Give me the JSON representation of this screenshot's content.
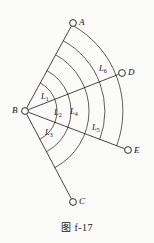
{
  "figure": {
    "caption_prefix": "图",
    "caption_number": "f-17",
    "caption_full": "图 f-17",
    "background_color": "#fbfbf9",
    "stroke_color": "#1a1a1a"
  },
  "vertices": [
    {
      "id": "A",
      "label": "A",
      "cx": 73,
      "cy": 23,
      "r": 3.4,
      "label_x": 79,
      "label_y": 18
    },
    {
      "id": "B",
      "label": "B",
      "cx": 25,
      "cy": 111,
      "r": 3.4,
      "label_x": 12,
      "label_y": 106
    },
    {
      "id": "C",
      "label": "C",
      "cx": 73,
      "cy": 202,
      "r": 3.4,
      "label_x": 79,
      "label_y": 197
    },
    {
      "id": "D",
      "label": "D",
      "cx": 122,
      "cy": 73,
      "r": 3.4,
      "label_x": 128,
      "label_y": 68
    },
    {
      "id": "E",
      "label": "E",
      "cx": 128,
      "cy": 150,
      "r": 3.4,
      "label_x": 134,
      "label_y": 146
    }
  ],
  "rays": [
    {
      "id": "BA",
      "from": "B",
      "to": "A"
    },
    {
      "id": "BD",
      "from": "B",
      "to": "D"
    },
    {
      "id": "BE",
      "from": "B",
      "to": "E"
    },
    {
      "id": "BC",
      "from": "B",
      "to": "C"
    }
  ],
  "arc_labels": [
    {
      "id": "L1",
      "base": "L",
      "sub": "1",
      "x": 41,
      "y": 92
    },
    {
      "id": "L2",
      "base": "L",
      "sub": "2",
      "x": 54,
      "y": 108
    },
    {
      "id": "L3",
      "base": "L",
      "sub": "3",
      "x": 45,
      "y": 128
    },
    {
      "id": "L4",
      "base": "L",
      "sub": "4",
      "x": 70,
      "y": 107
    },
    {
      "id": "L5",
      "base": "L",
      "sub": "5",
      "x": 92,
      "y": 123
    },
    {
      "id": "L6",
      "base": "L",
      "sub": "6",
      "x": 99,
      "y": 64
    }
  ],
  "arcs": [
    {
      "id": "arc-L1-inner",
      "radius": 32,
      "from_ray": "BA",
      "to_ray": "BD"
    },
    {
      "id": "arc-L1-outer",
      "radius": 46,
      "from_ray": "BA",
      "to_ray": "BD"
    },
    {
      "id": "arc-L2-inner",
      "radius": 32,
      "from_ray": "BD",
      "to_ray": "BE"
    },
    {
      "id": "arc-L2-outer",
      "radius": 46,
      "from_ray": "BD",
      "to_ray": "BE"
    },
    {
      "id": "arc-L3-inner",
      "radius": 32,
      "from_ray": "BE",
      "to_ray": "BC"
    },
    {
      "id": "arc-L3-outer",
      "radius": 46,
      "from_ray": "BE",
      "to_ray": "BC"
    },
    {
      "id": "arc-L4-outer",
      "radius": 64,
      "from_ray": "BA",
      "to_ray": "BC"
    },
    {
      "id": "arc-L5-outer",
      "radius": 80,
      "from_ray": "BA",
      "to_ray": "BE"
    },
    {
      "id": "arc-L6-outer",
      "radius": 98,
      "from_ray": "BA",
      "to_ray": "BE"
    }
  ]
}
